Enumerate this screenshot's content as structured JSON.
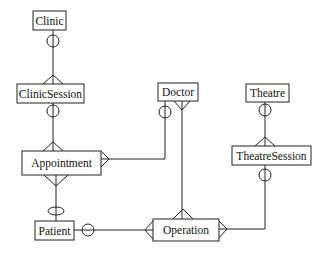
{
  "diagram": {
    "type": "entity-relationship",
    "notation": "crow's foot",
    "entities": [
      {
        "id": "clinic",
        "label": "Clinic"
      },
      {
        "id": "clinic_session",
        "label": "ClinicSession"
      },
      {
        "id": "appointment",
        "label": "Appointment"
      },
      {
        "id": "patient",
        "label": "Patient"
      },
      {
        "id": "doctor",
        "label": "Doctor"
      },
      {
        "id": "theatre",
        "label": "Theatre"
      },
      {
        "id": "theatre_session",
        "label": "TheatreSession"
      },
      {
        "id": "operation",
        "label": "Operation"
      }
    ],
    "relationships": [
      {
        "from": "Clinic",
        "from_end": "optional one",
        "to": "ClinicSession",
        "to_end": "many"
      },
      {
        "from": "ClinicSession",
        "from_end": "optional one",
        "to": "Appointment",
        "to_end": "many"
      },
      {
        "from": "Patient",
        "from_end": "optional one",
        "to": "Appointment",
        "to_end": "many"
      },
      {
        "from": "Doctor",
        "from_end": "optional one",
        "to": "Appointment",
        "to_end": "many"
      },
      {
        "from": "Doctor",
        "from_end": "many",
        "to": "Operation",
        "to_end": "many"
      },
      {
        "from": "Theatre",
        "from_end": "optional one",
        "to": "TheatreSession",
        "to_end": "many"
      },
      {
        "from": "TheatreSession",
        "from_end": "optional one",
        "to": "Operation",
        "to_end": "many"
      },
      {
        "from": "Patient",
        "from_end": "optional one",
        "to": "Operation",
        "to_end": "many"
      }
    ]
  }
}
